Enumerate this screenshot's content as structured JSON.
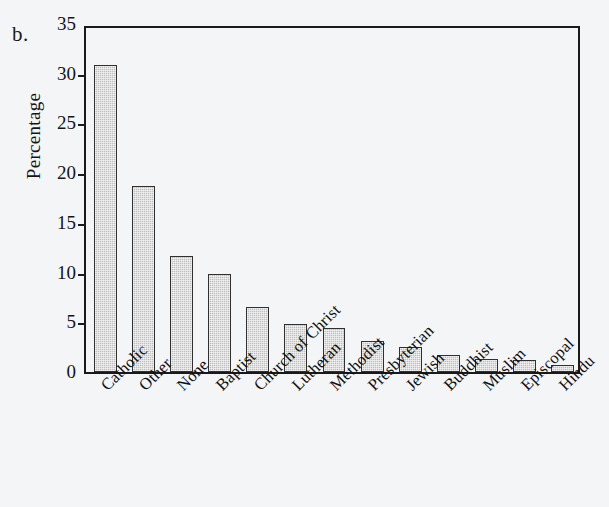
{
  "figure": {
    "panel_label": "b.",
    "background_color": "#f4f5f7"
  },
  "chart_data": {
    "type": "bar",
    "title": "",
    "xlabel": "",
    "ylabel": "Percentage",
    "categories": [
      "Catholic",
      "Other",
      "None",
      "Baptist",
      "Church of Christ",
      "Lutheran",
      "Methodist",
      "Presbyterian",
      "Jewish",
      "Buddhist",
      "Muslim",
      "Episcopal",
      "Hindu"
    ],
    "values": [
      30.9,
      18.7,
      11.7,
      9.9,
      6.5,
      4.8,
      4.4,
      3.1,
      2.5,
      1.7,
      1.3,
      1.2,
      0.7
    ],
    "ylim": [
      0,
      35
    ],
    "yticks": [
      0,
      5,
      10,
      15,
      20,
      25,
      30,
      35
    ],
    "ytick_labels": [
      "0",
      "5",
      "10",
      "15",
      "20",
      "25",
      "30",
      "35"
    ],
    "grid": false,
    "legend": null,
    "bar_fill_color": "#bfbfbf",
    "bar_edge_color": "#303030",
    "axis_color": "#1a1a1a"
  }
}
